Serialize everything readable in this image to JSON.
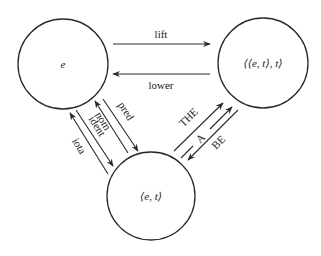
{
  "diagram": {
    "type": "type-shifting triangle",
    "nodes": [
      {
        "id": "e",
        "label": "e",
        "cx": 63,
        "cy": 64,
        "r": 45
      },
      {
        "id": "gq",
        "label": "⟨⟨e, t⟩, t⟩",
        "cx": 263,
        "cy": 63,
        "r": 45
      },
      {
        "id": "et",
        "label": "⟨e, t⟩",
        "cx": 151,
        "cy": 196,
        "r": 44
      }
    ],
    "edges": [
      {
        "id": "lift",
        "label": "lift",
        "from": "e",
        "to": "gq"
      },
      {
        "id": "lower",
        "label": "lower",
        "from": "gq",
        "to": "e"
      },
      {
        "id": "pred",
        "label": "pred",
        "from": "e",
        "to": "et"
      },
      {
        "id": "nom",
        "label": "nom",
        "from": "et",
        "to": "e"
      },
      {
        "id": "ident",
        "label": "ident",
        "from": "e",
        "to": "et"
      },
      {
        "id": "iota",
        "label": "iota",
        "from": "et",
        "to": "e"
      },
      {
        "id": "the",
        "label": "THE",
        "from": "et",
        "to": "gq"
      },
      {
        "id": "a",
        "label": "A",
        "from": "et",
        "to": "gq"
      },
      {
        "id": "be",
        "label": "BE",
        "from": "gq",
        "to": "et"
      }
    ]
  },
  "colors": {
    "stroke": "#2a2a2a",
    "text": "#222222",
    "background": "#ffffff"
  }
}
